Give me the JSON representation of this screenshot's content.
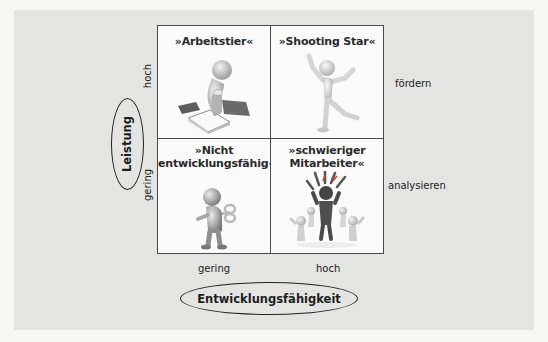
{
  "diagram": {
    "type": "2x2 portfolio matrix",
    "y_axis": {
      "title": "Leistung",
      "high_label": "hoch",
      "low_label": "gering"
    },
    "x_axis": {
      "title": "Entwicklungsfähigkeit",
      "low_label": "gering",
      "high_label": "hoch"
    },
    "quadrants": {
      "top_left": {
        "title": "»Arbeitstier«",
        "icon": "worker-figure-with-papers-icon"
      },
      "top_right": {
        "title": "»Shooting Star«",
        "icon": "jumping-happy-figure-icon"
      },
      "bottom_left": {
        "title": "»Nicht\nentwicklungsfähig«",
        "icon": "wind-up-toy-figure-icon"
      },
      "bottom_right": {
        "title": "»schwieriger\nMitarbeiter«",
        "icon": "angry-figure-with-group-icon"
      }
    },
    "row_actions": {
      "top": "fördern",
      "bottom": "analysieren"
    }
  },
  "colors": {
    "panel": "#e4e4e2",
    "page": "#f6f6f5",
    "grid_line": "#4a4a4a",
    "cell": "#fbfbfb",
    "angry_figure": "#4b4b4b",
    "figure_light": "#d2d2d2"
  }
}
